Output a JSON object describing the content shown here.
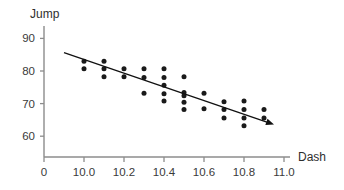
{
  "chart_data": {
    "type": "scatter",
    "title": "",
    "xlabel": "Dash",
    "ylabel": "Jump",
    "grid": false,
    "legend": null,
    "xlim": [
      9.9,
      11.0
    ],
    "ylim": [
      58,
      92
    ],
    "x_ticks": [
      "0",
      "10.0",
      "10.2",
      "10.4",
      "10.6",
      "10.8",
      "11.0"
    ],
    "x_tick_values": [
      0,
      10.0,
      10.2,
      10.4,
      10.6,
      10.8,
      11.0
    ],
    "x_axis_break_after_zero": true,
    "y_ticks": [
      "60",
      "70",
      "80",
      "90"
    ],
    "y_tick_values": [
      60,
      70,
      80,
      90
    ],
    "points": [
      {
        "x": 10.0,
        "y": 83.0
      },
      {
        "x": 10.0,
        "y": 80.7
      },
      {
        "x": 10.1,
        "y": 83.0
      },
      {
        "x": 10.1,
        "y": 80.7
      },
      {
        "x": 10.1,
        "y": 78.2
      },
      {
        "x": 10.2,
        "y": 80.7
      },
      {
        "x": 10.2,
        "y": 78.2
      },
      {
        "x": 10.3,
        "y": 80.7
      },
      {
        "x": 10.3,
        "y": 78.0
      },
      {
        "x": 10.3,
        "y": 73.2
      },
      {
        "x": 10.4,
        "y": 80.7
      },
      {
        "x": 10.4,
        "y": 78.0
      },
      {
        "x": 10.4,
        "y": 75.6
      },
      {
        "x": 10.4,
        "y": 73.0
      },
      {
        "x": 10.4,
        "y": 70.8
      },
      {
        "x": 10.5,
        "y": 78.2
      },
      {
        "x": 10.5,
        "y": 73.4
      },
      {
        "x": 10.5,
        "y": 72.4
      },
      {
        "x": 10.5,
        "y": 70.4
      },
      {
        "x": 10.5,
        "y": 68.2
      },
      {
        "x": 10.6,
        "y": 73.2
      },
      {
        "x": 10.6,
        "y": 68.4
      },
      {
        "x": 10.7,
        "y": 70.6
      },
      {
        "x": 10.7,
        "y": 68.2
      },
      {
        "x": 10.7,
        "y": 65.6
      },
      {
        "x": 10.8,
        "y": 70.8
      },
      {
        "x": 10.8,
        "y": 68.2
      },
      {
        "x": 10.8,
        "y": 65.6
      },
      {
        "x": 10.8,
        "y": 63.2
      },
      {
        "x": 10.9,
        "y": 68.2
      },
      {
        "x": 10.9,
        "y": 65.6
      }
    ],
    "trend_line": {
      "x_start": 9.9,
      "y_start": 85.6,
      "x_end": 10.95,
      "y_end": 63.6,
      "has_arrowhead": true,
      "arrow_at": "end"
    }
  },
  "colors": {
    "background": "#ffffff",
    "axis": "#8c8c8c",
    "tick_label": "#3a3a3a",
    "axis_title": "#2e2e2e",
    "point": "#1a1a1a",
    "trend_line": "#111111"
  }
}
